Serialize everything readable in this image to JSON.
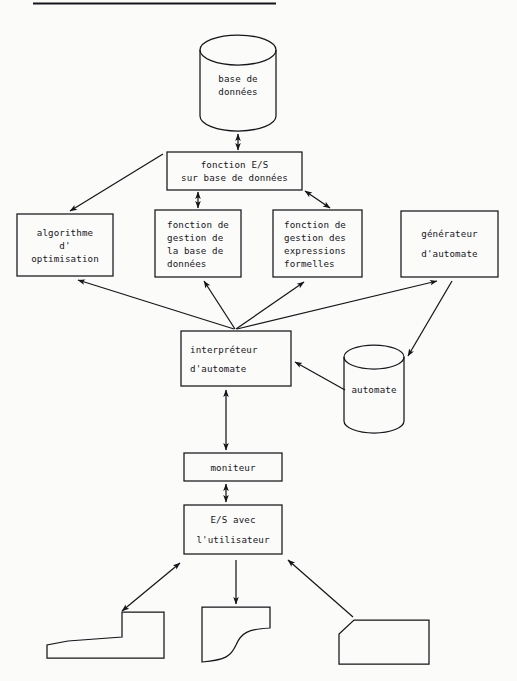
{
  "page": {
    "background_color": "#fbfbfa",
    "ink_color": "#16161a",
    "header_rule": true
  },
  "diagram": {
    "type": "flowchart",
    "notation": "boîtes, cylindres (bases de données) et flèches",
    "nodes": [
      {
        "id": "base-de-donnees",
        "shape": "cylinder",
        "lines": [
          "base de",
          "données"
        ],
        "x": 200,
        "y": 35,
        "w": 76,
        "h": 95
      },
      {
        "id": "fonction-es",
        "shape": "rect",
        "lines": [
          "fonction E/S",
          "sur base de données"
        ],
        "x": 167,
        "y": 152,
        "w": 135,
        "h": 38
      },
      {
        "id": "algorithme-optimisation",
        "shape": "rect",
        "lines": [
          "algorithme",
          "d'",
          "optimisation"
        ],
        "x": 17,
        "y": 214,
        "w": 96,
        "h": 62
      },
      {
        "id": "gestion-base-de-donnees",
        "shape": "rect",
        "lines": [
          "fonction de",
          "gestion de",
          "la base de",
          "données"
        ],
        "x": 155,
        "y": 210,
        "w": 86,
        "h": 67
      },
      {
        "id": "gestion-expressions-formelles",
        "shape": "rect",
        "lines": [
          "fonction de",
          "gestion des",
          "expressions",
          "formelles"
        ],
        "x": 273,
        "y": 210,
        "w": 89,
        "h": 67
      },
      {
        "id": "generateur-automate",
        "shape": "rect",
        "lines": [
          "générateur",
          "d'automate"
        ],
        "x": 401,
        "y": 211,
        "w": 97,
        "h": 66
      },
      {
        "id": "interpreteur-automate",
        "shape": "rect",
        "lines": [
          "interpréteur",
          "d'automate"
        ],
        "x": 181,
        "y": 331,
        "w": 110,
        "h": 55
      },
      {
        "id": "automate",
        "shape": "cylinder",
        "lines": [
          "automate"
        ],
        "x": 344,
        "y": 345,
        "w": 60,
        "h": 88
      },
      {
        "id": "moniteur",
        "shape": "rect",
        "lines": [
          "moniteur"
        ],
        "x": 184,
        "y": 453,
        "w": 98,
        "h": 28
      },
      {
        "id": "es-utilisateur",
        "shape": "rect",
        "lines": [
          "E/S avec",
          "l'utilisateur"
        ],
        "x": 184,
        "y": 505,
        "w": 98,
        "h": 49
      },
      {
        "id": "piece-gauche",
        "shape": "workpiece-step",
        "lines": [],
        "x": 47,
        "y": 612,
        "w": 117,
        "h": 46
      },
      {
        "id": "piece-centre",
        "shape": "workpiece-fillet",
        "lines": [],
        "x": 202,
        "y": 607,
        "w": 68,
        "h": 55
      },
      {
        "id": "piece-droite",
        "shape": "workpiece-chamfer",
        "lines": [],
        "x": 339,
        "y": 620,
        "w": 90,
        "h": 44
      }
    ],
    "edges": [
      {
        "from": "base-de-donnees",
        "to": "fonction-es",
        "arrow": "double"
      },
      {
        "from": "fonction-es",
        "to": "algorithme-optimisation",
        "arrow": "single"
      },
      {
        "from": "fonction-es",
        "to": "gestion-base-de-donnees",
        "arrow": "double"
      },
      {
        "from": "fonction-es",
        "to": "gestion-expressions-formelles",
        "arrow": "double"
      },
      {
        "from": "interpreteur-automate",
        "to": "algorithme-optimisation",
        "arrow": "single"
      },
      {
        "from": "interpreteur-automate",
        "to": "gestion-base-de-donnees",
        "arrow": "single"
      },
      {
        "from": "interpreteur-automate",
        "to": "gestion-expressions-formelles",
        "arrow": "single"
      },
      {
        "from": "interpreteur-automate",
        "to": "generateur-automate",
        "arrow": "single"
      },
      {
        "from": "generateur-automate",
        "to": "automate",
        "arrow": "single"
      },
      {
        "from": "automate",
        "to": "interpreteur-automate",
        "arrow": "single"
      },
      {
        "from": "interpreteur-automate",
        "to": "moniteur",
        "arrow": "double"
      },
      {
        "from": "moniteur",
        "to": "es-utilisateur",
        "arrow": "double"
      },
      {
        "from": "es-utilisateur",
        "to": "piece-gauche",
        "arrow": "double"
      },
      {
        "from": "es-utilisateur",
        "to": "piece-centre",
        "arrow": "single"
      },
      {
        "from": "piece-droite",
        "to": "es-utilisateur",
        "arrow": "single"
      }
    ]
  }
}
